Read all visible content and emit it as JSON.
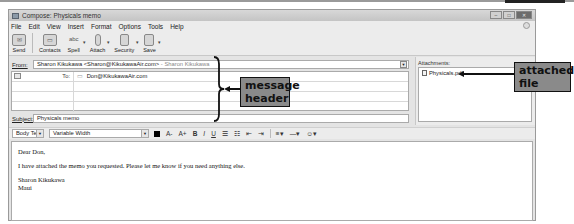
{
  "window": {
    "title": "Compose: Physicals memo",
    "controls": [
      "minimize",
      "maximize",
      "close"
    ]
  },
  "menubar": {
    "items": [
      "File",
      "Edit",
      "View",
      "Insert",
      "Format",
      "Options",
      "Tools",
      "Help"
    ]
  },
  "toolbar": {
    "buttons": [
      {
        "label": "Send",
        "icon": "send-icon"
      },
      {
        "label": "Contacts",
        "icon": "contacts-icon"
      },
      {
        "label": "Spell",
        "icon": "spell-icon"
      },
      {
        "label": "Attach",
        "icon": "attach-icon"
      },
      {
        "label": "Security",
        "icon": "security-icon"
      },
      {
        "label": "Save",
        "icon": "save-icon"
      }
    ]
  },
  "header": {
    "from_label": "From:",
    "from_value": "Sharon Kikukawa <Sharon@KikukawaAir.com>",
    "from_identity": "- Sharon Kikukawa",
    "recipients": [
      {
        "type": "To:",
        "address": "Don@KikukawaAir.com"
      }
    ],
    "subject_label": "Subject:",
    "subject_value": "Physicals memo"
  },
  "attachments": {
    "title": "Attachments:",
    "files": [
      "Physicals.pdf"
    ]
  },
  "format_bar": {
    "paragraph_style": "Body Text",
    "font": "Variable Width",
    "buttons": [
      "A-",
      "A+",
      "B",
      "I",
      "U"
    ]
  },
  "body": {
    "lines": [
      "Dear Don,",
      "I have attached the memo you requested. Please let me know if you need anything else.",
      "Sharon Kikukawa",
      "Maui"
    ]
  },
  "annotations": {
    "message_header": "message header",
    "attached_file": "attached file"
  }
}
